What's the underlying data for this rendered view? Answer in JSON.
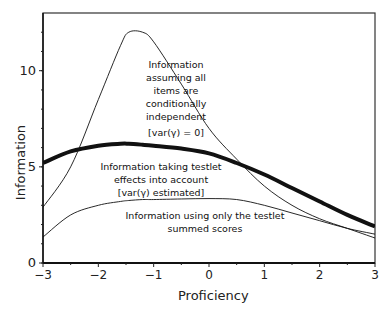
{
  "chart_data": {
    "type": "line",
    "title": "",
    "xlabel": "Proficiency",
    "ylabel": "Information",
    "xlim": [
      -3,
      3
    ],
    "ylim": [
      0,
      13
    ],
    "grid": false,
    "legend": "none (inline annotations)",
    "xticks": [
      "-3",
      "-2",
      "-1",
      "0",
      "1",
      "2",
      "3"
    ],
    "yticks": [
      "0",
      "5",
      "10"
    ],
    "x": [
      -3,
      -2.5,
      -2,
      -1.6,
      -1.45,
      -1.2,
      -1,
      -0.5,
      0,
      0.5,
      1,
      1.5,
      2,
      2.5,
      3
    ],
    "series": [
      {
        "name": "Information assuming all items are conditionally independent [var(γ) = 0]",
        "style": "thin",
        "values": [
          2.9,
          5.0,
          8.5,
          11.3,
          12.0,
          12.0,
          11.5,
          9.3,
          7.0,
          5.4,
          4.0,
          3.0,
          2.3,
          1.8,
          1.3
        ]
      },
      {
        "name": "Information taking testlet effects into account [var(γ) estimated]",
        "style": "thick",
        "values": [
          5.2,
          5.8,
          6.1,
          6.2,
          6.2,
          6.15,
          6.1,
          5.95,
          5.7,
          5.2,
          4.6,
          3.9,
          3.2,
          2.5,
          1.9
        ]
      },
      {
        "name": "Information using only the testlet summed scores",
        "style": "thin",
        "values": [
          1.35,
          2.5,
          3.0,
          3.2,
          3.25,
          3.3,
          3.3,
          3.33,
          3.35,
          3.3,
          3.0,
          2.6,
          2.2,
          1.8,
          1.5
        ]
      }
    ],
    "annotations": [
      {
        "lines": [
          "Information",
          "assuming all",
          "items are",
          "conditionally",
          "independent",
          "",
          "[var(γ) = 0]"
        ]
      },
      {
        "lines": [
          "Information taking testlet",
          "effects  into account",
          "[var(γ) estimated]"
        ]
      },
      {
        "lines": [
          "Information using only the testlet",
          "summed scores"
        ]
      }
    ]
  },
  "labels": {
    "ann1": "Information\nassuming all\nitems are\nconditionally\nindependent",
    "ann1b": "[var(γ) = 0]",
    "ann2": "Information taking testlet\neffects  into account\n[var(γ) estimated]",
    "ann3": "Information using only the testlet\nsummed scores",
    "xlabel": "Proficiency",
    "ylabel": "Information"
  }
}
